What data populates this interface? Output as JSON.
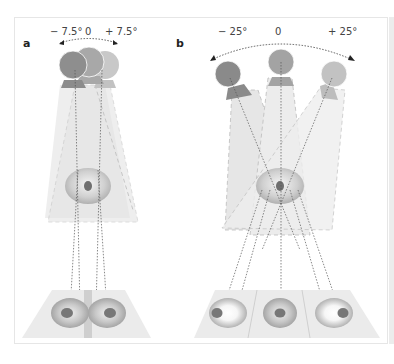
{
  "figure": {
    "panels": [
      {
        "id": "a",
        "label": "a",
        "angles": {
          "left": "− 7.5°",
          "center": "0",
          "right": "+ 7.5°"
        },
        "description": "Small head rotation: three overlapping probe positions converge on one eye; image plane shows two adjacent eye images separated by a bar"
      },
      {
        "id": "b",
        "label": "b",
        "angles": {
          "left": "− 25°",
          "center": "0",
          "right": "+ 25°"
        },
        "description": "Large head rotation: three separated probe positions converge on one eye; image plane split into three panels with eye images"
      }
    ],
    "colors": {
      "probe_left": "#8a8a8a",
      "probe_center": "#a3a3a3",
      "probe_right": "#c2c2c2",
      "beam": "#e2e2e2",
      "plane": "#ebebeb",
      "eye_outer": "#bdbdbd",
      "pupil": "#6f6f6f",
      "frame_border": "#e6e6e6"
    }
  }
}
